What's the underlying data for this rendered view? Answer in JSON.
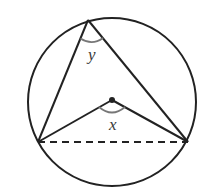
{
  "diagram": {
    "type": "circle-inscribed-angle",
    "colors": {
      "stroke": "#222222",
      "arc": "#777777",
      "label": "#3a3a3a",
      "background": "#ffffff"
    },
    "circle": {
      "cx": 112,
      "cy": 102,
      "r": 84
    },
    "points": {
      "top": {
        "x": 88,
        "y": 20
      },
      "left": {
        "x": 38,
        "y": 142
      },
      "right": {
        "x": 188,
        "y": 142
      },
      "center": {
        "x": 112,
        "y": 100
      }
    },
    "labels": {
      "inscribed_angle": "y",
      "central_angle": "x"
    },
    "chord_style": "dashed"
  }
}
